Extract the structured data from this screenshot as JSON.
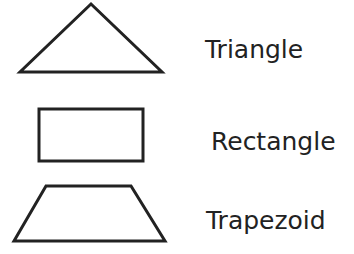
{
  "shapes": [
    {
      "name": "triangle",
      "label": "Triangle"
    },
    {
      "name": "rectangle",
      "label": "Rectangle"
    },
    {
      "name": "trapezoid",
      "label": "Trapezoid"
    }
  ],
  "colors": {
    "stroke": "#222222",
    "text": "#222222",
    "background": "#ffffff"
  }
}
